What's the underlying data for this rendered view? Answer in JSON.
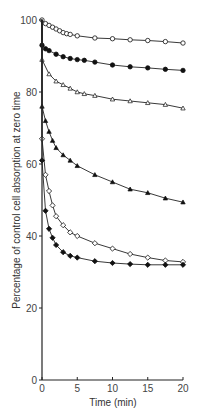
{
  "chart_data": {
    "type": "line",
    "title": "",
    "xlabel": "Time (min)",
    "ylabel": "Percentage of control cell absorption at zero time",
    "xlim": [
      0,
      20
    ],
    "ylim": [
      0,
      100
    ],
    "xticks": [
      0,
      5,
      10,
      15,
      20
    ],
    "yticks": [
      0,
      20,
      40,
      60,
      80,
      100
    ],
    "grid": false,
    "legend": null,
    "series": [
      {
        "name": "open-circle",
        "marker": "open-circle",
        "x": [
          0,
          0.5,
          1,
          1.5,
          2,
          2.5,
          3,
          3.5,
          4,
          5,
          7.5,
          10,
          12.5,
          15,
          17.5,
          20
        ],
        "y": [
          100,
          99,
          98.5,
          98,
          97.5,
          97,
          96.5,
          96.2,
          96,
          95.6,
          95,
          94.8,
          94.5,
          94.3,
          94,
          93.6
        ]
      },
      {
        "name": "filled-circle",
        "marker": "filled-circle",
        "x": [
          0,
          0.5,
          1,
          2,
          3,
          4,
          5,
          6,
          7.5,
          10,
          12.5,
          15,
          17.5,
          20
        ],
        "y": [
          93,
          92,
          91.5,
          90.5,
          89.8,
          89.3,
          89,
          88.8,
          88.3,
          87.5,
          87,
          86.7,
          86.3,
          86
        ]
      },
      {
        "name": "open-triangle",
        "marker": "open-triangle",
        "x": [
          0,
          1,
          2,
          3,
          4,
          5,
          6,
          7.5,
          10,
          12.5,
          15,
          17.5,
          20
        ],
        "y": [
          89,
          85,
          83,
          82,
          81,
          80,
          79.5,
          79,
          78,
          77.5,
          77,
          76.5,
          75.5
        ]
      },
      {
        "name": "filled-triangle",
        "marker": "filled-triangle",
        "x": [
          0,
          0.5,
          1,
          1.5,
          2,
          3,
          4,
          5,
          7.5,
          10,
          12.5,
          15,
          17.5,
          20
        ],
        "y": [
          76,
          72,
          69,
          66.5,
          64.5,
          62.5,
          61,
          59.5,
          57,
          55,
          53,
          52,
          50.5,
          49.4
        ]
      },
      {
        "name": "open-diamond",
        "marker": "open-diamond",
        "x": [
          0,
          0.5,
          1,
          1.5,
          2,
          3,
          4,
          5,
          7.5,
          10,
          12.5,
          15,
          17.5,
          20
        ],
        "y": [
          67,
          57,
          52.5,
          48.5,
          45.5,
          43,
          41,
          40,
          38,
          36.5,
          35,
          34,
          33.2,
          32.8
        ]
      },
      {
        "name": "filled-diamond",
        "marker": "filled-diamond",
        "x": [
          0,
          0.5,
          1,
          1.5,
          2,
          3,
          4,
          5,
          7.5,
          10,
          12.5,
          15,
          17.5,
          20
        ],
        "y": [
          61,
          47,
          42,
          39.5,
          37.5,
          35.5,
          34.5,
          34,
          33,
          32.5,
          32.2,
          32,
          32,
          32
        ]
      }
    ]
  },
  "axes": {
    "xlabel": "Time (min)",
    "ylabel": "Percentage of control cell absorption at zero time",
    "x_ticks": [
      "0",
      "5",
      "10",
      "15",
      "20"
    ],
    "y_ticks": [
      "0",
      "20",
      "40",
      "60",
      "80",
      "100"
    ]
  }
}
